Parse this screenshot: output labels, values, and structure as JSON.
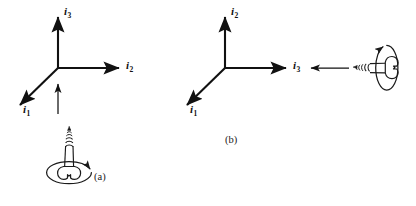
{
  "figure": {
    "type": "diagram",
    "background_color": "#ffffff",
    "ink_color": "#111111",
    "width": 416,
    "height": 206
  },
  "panels": [
    {
      "id": "a",
      "caption": "(a)",
      "caption_x": 93,
      "caption_y": 172,
      "origin": {
        "x": 58,
        "y": 68
      },
      "axes": [
        {
          "name": "i3",
          "label_base": "i",
          "label_sub": "3",
          "direction": "up",
          "tip": {
            "x": 58,
            "y": 14
          },
          "label_x": 64,
          "label_y": 9
        },
        {
          "name": "i2",
          "label_base": "i",
          "label_sub": "2",
          "direction": "right",
          "tip": {
            "x": 122,
            "y": 68
          },
          "label_x": 127,
          "label_y": 63
        },
        {
          "name": "i1",
          "label_base": "i",
          "label_sub": "1",
          "direction": "down-left",
          "tip": {
            "x": 17,
            "y": 108
          },
          "label_x": 23,
          "label_y": 110
        }
      ],
      "direction_arrow": {
        "name": "translation-arrow",
        "orientation": "up",
        "from": {
          "x": 58,
          "y": 114
        },
        "to": {
          "x": 58,
          "y": 82
        }
      },
      "screw": {
        "name": "screw-vertical",
        "orientation": "vertical-up",
        "head_position": "bottom",
        "tip_position": "top",
        "rotation_arrow": "clockwise-viewed-from-head",
        "center_x": 71,
        "head_y": 178,
        "tip_y": 130
      }
    },
    {
      "id": "b",
      "caption": "(b)",
      "caption_x": 225,
      "caption_y": 135,
      "origin": {
        "x": 225,
        "y": 68
      },
      "axes": [
        {
          "name": "i2",
          "label_base": "i",
          "label_sub": "2",
          "direction": "up",
          "tip": {
            "x": 225,
            "y": 14
          },
          "label_x": 231,
          "label_y": 9
        },
        {
          "name": "i3",
          "label_base": "i",
          "label_sub": "3",
          "direction": "right",
          "tip": {
            "x": 289,
            "y": 68
          },
          "label_x": 294,
          "label_y": 63
        },
        {
          "name": "i1",
          "label_base": "i",
          "label_sub": "1",
          "direction": "down-left",
          "tip": {
            "x": 184,
            "y": 108
          },
          "label_x": 190,
          "label_y": 110
        }
      ],
      "direction_arrow": {
        "name": "translation-arrow",
        "orientation": "left",
        "from": {
          "x": 349,
          "y": 68
        },
        "to": {
          "x": 309,
          "y": 68
        }
      },
      "screw": {
        "name": "screw-horizontal",
        "orientation": "horizontal-left",
        "head_position": "right",
        "tip_position": "left",
        "rotation_arrow": "clockwise-viewed-from-head",
        "center_y": 68,
        "head_x": 390,
        "tip_x": 356
      }
    }
  ]
}
